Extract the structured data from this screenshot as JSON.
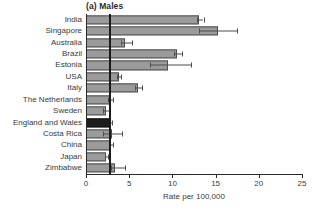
{
  "chart_data": {
    "type": "bar",
    "orientation": "horizontal",
    "title": "(a) Males",
    "xlabel": "Rate per 100,000",
    "ylabel": "",
    "xlim": [
      0,
      25
    ],
    "xticks": [
      0,
      5,
      10,
      15,
      20,
      25
    ],
    "xtick_labels": [
      "0",
      "5",
      "10",
      "15",
      "20",
      "25"
    ],
    "grid": false,
    "legend": "none",
    "reference_line": 2.7,
    "highlight_category": "England and Wales",
    "highlight_color": "#1d1d1d",
    "bar_color": "#9b9b9b",
    "bar_edge_color": "#4d4d4d",
    "categories": [
      "India",
      "Singapore",
      "Australia",
      "Brazil",
      "Estonia",
      "USA",
      "Italy",
      "The Netherlands",
      "Sweden",
      "England and Wales",
      "Costa Rica",
      "China",
      "Japan",
      "Zimbabwe"
    ],
    "values": [
      13.1,
      15.3,
      4.5,
      10.5,
      9.5,
      3.8,
      6.0,
      2.8,
      2.3,
      2.8,
      3.0,
      2.9,
      2.3,
      3.4
    ],
    "error_low": [
      12.8,
      13.1,
      4.1,
      10.2,
      7.4,
      3.6,
      5.7,
      2.6,
      2.0,
      2.7,
      2.0,
      2.8,
      2.2,
      2.9
    ],
    "error_high": [
      13.6,
      17.5,
      5.3,
      11.1,
      12.2,
      4.0,
      6.5,
      3.1,
      2.7,
      3.0,
      4.2,
      3.1,
      2.5,
      4.5
    ]
  }
}
